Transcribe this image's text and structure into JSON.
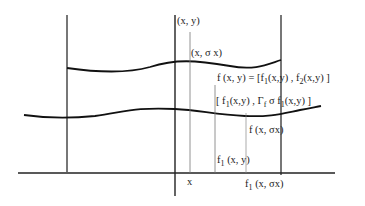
{
  "diagram": {
    "labels": {
      "point_xy": "(x, y)",
      "point_x_sigma_x": "(x, σ x)",
      "f_def": {
        "prefix": "f (x, y) = [f",
        "sub1": "1",
        "mid": "(x,y) , f",
        "sub2": "2",
        "suffix": "(x,y) ]"
      },
      "pair": {
        "prefix": "[ f",
        "sub1": "1",
        "mid": "(x,y) , Γ",
        "sub_f": "f",
        "mid2": " σ f",
        "sub2": "1",
        "suffix": "(x,y) ]"
      },
      "f_x_sigma_x": "f (x, σx)",
      "f1_xy": {
        "prefix": "f",
        "sub": "1",
        "suffix": " (x, y)"
      },
      "x_axis_label": "x",
      "f1_x_sigma_x": {
        "prefix": "f",
        "sub": "1",
        "suffix": " (x, σx)"
      }
    }
  }
}
